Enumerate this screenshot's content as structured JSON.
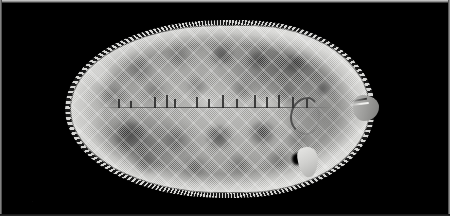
{
  "plate": {
    "caption": "",
    "background_color": "#000000",
    "border_color": "#b4b4b4",
    "width_px": 450,
    "height_px": 216
  },
  "photograph": {
    "subject": "flatfish specimen, lateral whole-body view",
    "common_name": "sole",
    "orientation": "head at right, tail at left",
    "medium": "black and white halftone print",
    "background_color": "#000000",
    "body_tone_light": "#c2c2c0",
    "body_tone_mid": "#9a9a98",
    "body_tone_dark": "#343434"
  },
  "anatomy": {
    "body": "body-mass",
    "dorsal_fin": "dorsal-fin-fringe",
    "anal_fin": "anal-fin-fringe",
    "caudal_fin": "caudal-fin",
    "pectoral_fin": "pectoral-fin",
    "pelvic_fin": "pelvic-fin",
    "eye": "eye",
    "mouth": "mouth",
    "snout": "snout",
    "opercle": "opercle",
    "lateral_line": "lateral-line"
  },
  "specimen_mark": {
    "label": "·"
  },
  "pattern": {
    "blotches": [
      {
        "x": 54,
        "y": 34,
        "w": 30,
        "h": 22,
        "kind": "soft"
      },
      {
        "x": 96,
        "y": 22,
        "w": 26,
        "h": 20,
        "kind": "soft"
      },
      {
        "x": 138,
        "y": 20,
        "w": 28,
        "h": 20,
        "kind": "blotch"
      },
      {
        "x": 176,
        "y": 26,
        "w": 24,
        "h": 18,
        "kind": "blotch"
      },
      {
        "x": 214,
        "y": 30,
        "w": 22,
        "h": 18,
        "kind": "blotch"
      },
      {
        "x": 30,
        "y": 60,
        "w": 26,
        "h": 22,
        "kind": "soft"
      },
      {
        "x": 72,
        "y": 56,
        "w": 24,
        "h": 20,
        "kind": "soft"
      },
      {
        "x": 116,
        "y": 52,
        "w": 22,
        "h": 18,
        "kind": "soft"
      },
      {
        "x": 160,
        "y": 56,
        "w": 24,
        "h": 18,
        "kind": "soft"
      },
      {
        "x": 206,
        "y": 58,
        "w": 22,
        "h": 18,
        "kind": "soft"
      },
      {
        "x": 44,
        "y": 96,
        "w": 32,
        "h": 26,
        "kind": "blotch"
      },
      {
        "x": 92,
        "y": 104,
        "w": 28,
        "h": 22,
        "kind": "soft"
      },
      {
        "x": 134,
        "y": 100,
        "w": 30,
        "h": 24,
        "kind": "blotch"
      },
      {
        "x": 178,
        "y": 96,
        "w": 28,
        "h": 24,
        "kind": "blotch"
      },
      {
        "x": 216,
        "y": 104,
        "w": 24,
        "h": 20,
        "kind": "soft"
      },
      {
        "x": 62,
        "y": 128,
        "w": 28,
        "h": 20,
        "kind": "soft"
      },
      {
        "x": 110,
        "y": 132,
        "w": 30,
        "h": 20,
        "kind": "soft"
      },
      {
        "x": 156,
        "y": 130,
        "w": 26,
        "h": 18,
        "kind": "soft"
      },
      {
        "x": 196,
        "y": 126,
        "w": 24,
        "h": 18,
        "kind": "soft"
      },
      {
        "x": 20,
        "y": 40,
        "w": 24,
        "h": 20,
        "kind": "pale"
      },
      {
        "x": 124,
        "y": 68,
        "w": 26,
        "h": 16,
        "kind": "pale"
      },
      {
        "x": 188,
        "y": 70,
        "w": 22,
        "h": 14,
        "kind": "pale"
      }
    ],
    "lateral_dashes": [
      {
        "x": 48,
        "y": 74,
        "h": 9
      },
      {
        "x": 60,
        "y": 76,
        "h": 7
      },
      {
        "x": 84,
        "y": 72,
        "h": 11
      },
      {
        "x": 96,
        "y": 70,
        "h": 13
      },
      {
        "x": 104,
        "y": 74,
        "h": 9
      },
      {
        "x": 126,
        "y": 72,
        "h": 11
      },
      {
        "x": 138,
        "y": 74,
        "h": 9
      },
      {
        "x": 152,
        "y": 70,
        "h": 13
      },
      {
        "x": 166,
        "y": 74,
        "h": 9
      },
      {
        "x": 184,
        "y": 70,
        "h": 13
      },
      {
        "x": 196,
        "y": 72,
        "h": 11
      },
      {
        "x": 208,
        "y": 70,
        "h": 13
      },
      {
        "x": 222,
        "y": 72,
        "h": 11
      },
      {
        "x": 236,
        "y": 74,
        "h": 9
      }
    ]
  }
}
